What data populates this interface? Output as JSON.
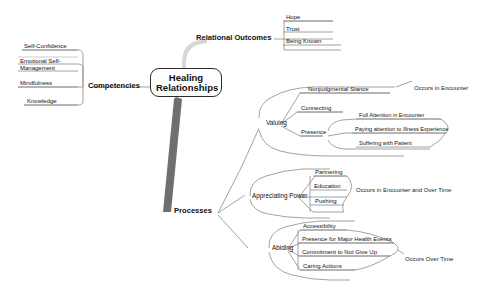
{
  "diagram": {
    "title": "Healing Relationships",
    "type": "mind-map",
    "root": {
      "line1": "Healing",
      "line2": "Relationships"
    },
    "colors": {
      "root_border": "#2b2b2b",
      "trunk": "#6b6b6b",
      "branch_line": "#8c8c8c",
      "text": "#111111",
      "background": "#ffffff"
    },
    "branches": [
      {
        "id": "competencies",
        "label": "Competencies",
        "side": "left",
        "children": [
          {
            "label": "Self-Confidence"
          },
          {
            "label": "Emotional Self-Management"
          },
          {
            "label": "Mindfulness"
          },
          {
            "label": "Knowledge"
          }
        ]
      },
      {
        "id": "relational-outcomes",
        "label": "Relational Outcomes",
        "side": "top",
        "children": [
          {
            "label": "Hope"
          },
          {
            "label": "Trust"
          },
          {
            "label": "Being Known"
          }
        ]
      },
      {
        "id": "processes",
        "label": "Processes",
        "side": "bottom-right",
        "children": [
          {
            "id": "valuing",
            "label": "Valuing",
            "note": "Occurs in Encounter",
            "children": [
              {
                "label": "Nonjudgmental Stance"
              },
              {
                "label": "Connecting"
              },
              {
                "label": "Presence",
                "children": [
                  {
                    "label": "Full Attention in Encounter"
                  },
                  {
                    "label": "Paying attention to Illness Experience"
                  },
                  {
                    "label": "Suffering with Patient"
                  }
                ]
              }
            ]
          },
          {
            "id": "appreciating-power",
            "label": "Appreciating Power",
            "note": "Occurs in Encounter and Over Time",
            "children": [
              {
                "label": "Partnering"
              },
              {
                "label": "Education"
              },
              {
                "label": "Pushing"
              }
            ]
          },
          {
            "id": "abiding",
            "label": "Abiding",
            "note": "Occurs Over Time",
            "children": [
              {
                "label": "Accessibility"
              },
              {
                "label": "Presence for Major Health Events"
              },
              {
                "label": "Commitment to Not Give Up"
              },
              {
                "label": "Caring Actions"
              }
            ]
          }
        ]
      }
    ]
  }
}
